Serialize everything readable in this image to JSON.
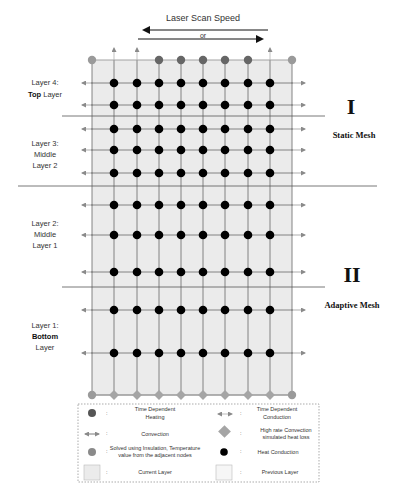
{
  "title": "Laser Scan Speed",
  "direction_or": "or",
  "colors": {
    "shade": "#e9e9e9",
    "grid_line": "#777777",
    "heat_node": "#000000",
    "heating_node": "#666666",
    "insulated_node": "#9a9a9a",
    "convection_diamond": "#a5a5a5",
    "arrow_gray": "#8a8a8a"
  },
  "layers": [
    {
      "name": "layer-4",
      "line1": "Layer 4:",
      "bold": "Top",
      "line2": " Layer",
      "line3": ""
    },
    {
      "name": "layer-3",
      "line1": "Layer 3:",
      "bold": "",
      "line2": "Middle",
      "line3": "Layer 2"
    },
    {
      "name": "layer-2",
      "line1": "Layer 2:",
      "bold": "",
      "line2": "Middle",
      "line3": "Layer 1"
    },
    {
      "name": "layer-1",
      "line1": "Layer 1:",
      "bold": "Bottom",
      "line2": "",
      "line3": "Layer"
    }
  ],
  "regions": [
    {
      "numeral": "I",
      "label": "Static Mesh"
    },
    {
      "numeral": "II",
      "label": "Adaptive Mesh"
    }
  ],
  "grid": {
    "columns_x": [
      114,
      137,
      159,
      181,
      203,
      225,
      248,
      270
    ],
    "rows_y": [
      83,
      105,
      129,
      150,
      173,
      205,
      235,
      272,
      310,
      353
    ],
    "left_x": 92,
    "right_x": 292,
    "top_y": 60,
    "bottom_y": 395,
    "top_row": [
      "insulated",
      "arrow",
      "arrow",
      "heating",
      "heating",
      "heating",
      "heating",
      "heating",
      "arrow",
      "insulated"
    ],
    "bottom_row": [
      "insulated",
      "diamond",
      "diamond",
      "diamond",
      "diamond",
      "diamond",
      "diamond",
      "diamond",
      "diamond",
      "insulated"
    ]
  },
  "legend": {
    "items": [
      {
        "symbol": "heating-dot",
        "sep": ":",
        "line1": "Time Dependent",
        "line2": "Heating"
      },
      {
        "symbol": "conduction-arrow",
        "sep": ":",
        "line1": "Time Dependent",
        "line2": "Conduction"
      },
      {
        "symbol": "convection-arrow",
        "sep": ":",
        "line1": "Convection",
        "line2": ""
      },
      {
        "symbol": "diamond",
        "sep": ":",
        "line1": "High rate Convection",
        "line2": "simulated heat loss"
      },
      {
        "symbol": "insulated-dot",
        "sep": ":",
        "line1": "Solved using Insulation, Temperature",
        "line2": "value from the adjacent nodes"
      },
      {
        "symbol": "heat-dot",
        "sep": ":",
        "line1": "Heat Conduction",
        "line2": ""
      },
      {
        "symbol": "current-layer-box",
        "sep": ":",
        "line1": "Current Layer",
        "line2": ""
      },
      {
        "symbol": "previous-layer-box",
        "sep": ":",
        "line1": "Previous Layer",
        "line2": ""
      }
    ]
  }
}
